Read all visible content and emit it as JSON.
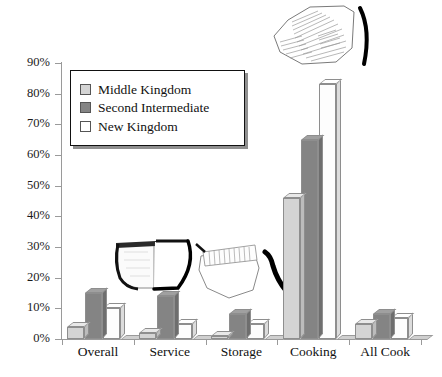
{
  "chart_data": {
    "type": "bar",
    "title": "",
    "xlabel": "",
    "ylabel": "",
    "ylim": [
      0,
      90
    ],
    "ytick_step": 10,
    "ytick_labels": [
      "0%",
      "10%",
      "20%",
      "30%",
      "40%",
      "50%",
      "60%",
      "70%",
      "80%",
      "90%"
    ],
    "ytick_values": [
      0,
      10,
      20,
      30,
      40,
      50,
      60,
      70,
      80,
      90
    ],
    "grid": false,
    "legend_position": "upper-left-inset",
    "categories": [
      "Overall",
      "Service",
      "Storage",
      "Cooking",
      "All Cook"
    ],
    "series": [
      {
        "name": "Middle Kingdom",
        "color": "#d4d4d4",
        "values": [
          4,
          2,
          1,
          46,
          5
        ]
      },
      {
        "name": "Second Intermediate",
        "color": "#848484",
        "values": [
          15,
          14,
          8,
          65,
          8
        ]
      },
      {
        "name": "New Kingdom",
        "color": "#fdfdfd",
        "values": [
          10,
          5,
          5,
          83,
          7
        ]
      }
    ],
    "annotations": [
      "pottery-sherd-hatched-top-right",
      "pottery-vessel-cup-profile",
      "pottery-sherd-hatched-middle"
    ]
  },
  "legend": {
    "items": [
      {
        "label": "Middle Kingdom",
        "swatch": "#d4d4d4"
      },
      {
        "label": "Second Intermediate",
        "swatch": "#848484"
      },
      {
        "label": "New Kingdom",
        "swatch": "#ffffff"
      }
    ]
  }
}
